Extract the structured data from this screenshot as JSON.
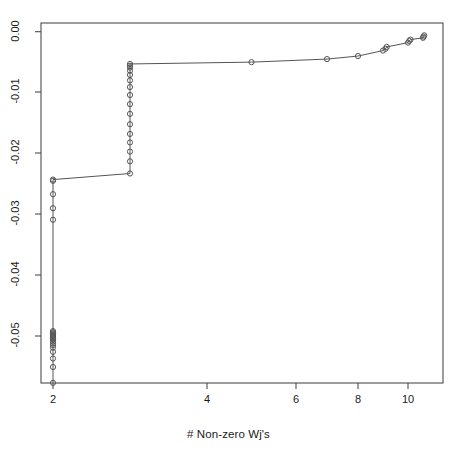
{
  "chart_data": {
    "type": "line",
    "title": "",
    "subtitle": "",
    "xlabel": "# Non-zero Wj's",
    "ylabel": "",
    "grid": false,
    "legend": null,
    "marker": "open-circle",
    "line_color": "#555555",
    "marker_color": "#555555",
    "axis_color": "#4d4d4d",
    "background": "#ffffff",
    "xlim": [
      1.78,
      10.85
    ],
    "ylim": [
      -0.0577,
      0.0013
    ],
    "xticks": [
      2,
      4,
      6,
      8,
      10
    ],
    "xtick_labels": [
      "2",
      "4",
      "6",
      "8",
      "10"
    ],
    "yticks": [
      0.0,
      -0.01,
      -0.02,
      -0.03,
      -0.04,
      -0.05
    ],
    "ytick_labels": [
      "0.00",
      "-0.01",
      "-0.02",
      "-0.03",
      "-0.04",
      "-0.05"
    ],
    "x_axis_scale": "nonlinear",
    "xtick_pixels": [
      53,
      207,
      296,
      358,
      408
    ],
    "ytick_pixels": [
      31.7,
      92,
      153,
      214,
      275,
      336
    ],
    "plot_box_pixels": {
      "left": 41,
      "right": 443,
      "top": 23,
      "bottom": 383
    },
    "points": [
      {
        "x": 2.0,
        "y": -0.0577
      },
      {
        "x": 2.0,
        "y": -0.0551
      },
      {
        "x": 2.0,
        "y": -0.0537
      },
      {
        "x": 2.0,
        "y": -0.0526
      },
      {
        "x": 2.0,
        "y": -0.0519
      },
      {
        "x": 2.0,
        "y": -0.0515
      },
      {
        "x": 2.0,
        "y": -0.0512
      },
      {
        "x": 2.0,
        "y": -0.0509
      },
      {
        "x": 2.0,
        "y": -0.0506
      },
      {
        "x": 2.0,
        "y": -0.0504
      },
      {
        "x": 2.0,
        "y": -0.0502
      },
      {
        "x": 2.0,
        "y": -0.05
      },
      {
        "x": 2.0,
        "y": -0.0498
      },
      {
        "x": 2.0,
        "y": -0.0496
      },
      {
        "x": 2.0,
        "y": -0.0494
      },
      {
        "x": 2.0,
        "y": -0.0492
      },
      {
        "x": 2.0,
        "y": -0.0309
      },
      {
        "x": 2.0,
        "y": -0.029
      },
      {
        "x": 2.0,
        "y": -0.0267
      },
      {
        "x": 2.0,
        "y": -0.0245
      },
      {
        "x": 2.0,
        "y": -0.0243
      },
      {
        "x": 3.0,
        "y": -0.0233
      },
      {
        "x": 3.0,
        "y": -0.0213
      },
      {
        "x": 3.0,
        "y": -0.0197
      },
      {
        "x": 3.0,
        "y": -0.0182
      },
      {
        "x": 3.0,
        "y": -0.0168
      },
      {
        "x": 3.0,
        "y": -0.0152
      },
      {
        "x": 3.0,
        "y": -0.0135
      },
      {
        "x": 3.0,
        "y": -0.0119
      },
      {
        "x": 3.0,
        "y": -0.0104
      },
      {
        "x": 3.0,
        "y": -0.0091
      },
      {
        "x": 3.0,
        "y": -0.008
      },
      {
        "x": 3.0,
        "y": -0.0071
      },
      {
        "x": 3.0,
        "y": -0.0064
      },
      {
        "x": 3.0,
        "y": -0.0059
      },
      {
        "x": 3.0,
        "y": -0.0056
      },
      {
        "x": 3.0,
        "y": -0.0053
      },
      {
        "x": 5.0,
        "y": -0.005
      },
      {
        "x": 7.0,
        "y": -0.0045
      },
      {
        "x": 8.0,
        "y": -0.004
      },
      {
        "x": 9.0,
        "y": -0.0031
      },
      {
        "x": 9.1,
        "y": -0.0028
      },
      {
        "x": 9.15,
        "y": -0.0025
      },
      {
        "x": 10.0,
        "y": -0.0018
      },
      {
        "x": 10.05,
        "y": -0.0015
      },
      {
        "x": 10.1,
        "y": -0.0013
      },
      {
        "x": 10.6,
        "y": -0.001
      },
      {
        "x": 10.62,
        "y": -0.0008
      },
      {
        "x": 10.65,
        "y": -0.0006
      }
    ]
  }
}
